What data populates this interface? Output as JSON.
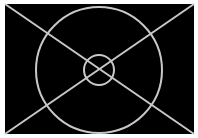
{
  "colors": {
    "background": "#ffffff",
    "frame_fill": "#000000",
    "line": "#c8c8c8"
  },
  "figure": {
    "frame": {
      "x": 5,
      "y": 4,
      "width": 189,
      "height": 130
    },
    "center": {
      "x": 99,
      "y": 70
    },
    "outer_circle_radius": 63,
    "inner_circle_radius": 15,
    "stroke_width": 2
  }
}
